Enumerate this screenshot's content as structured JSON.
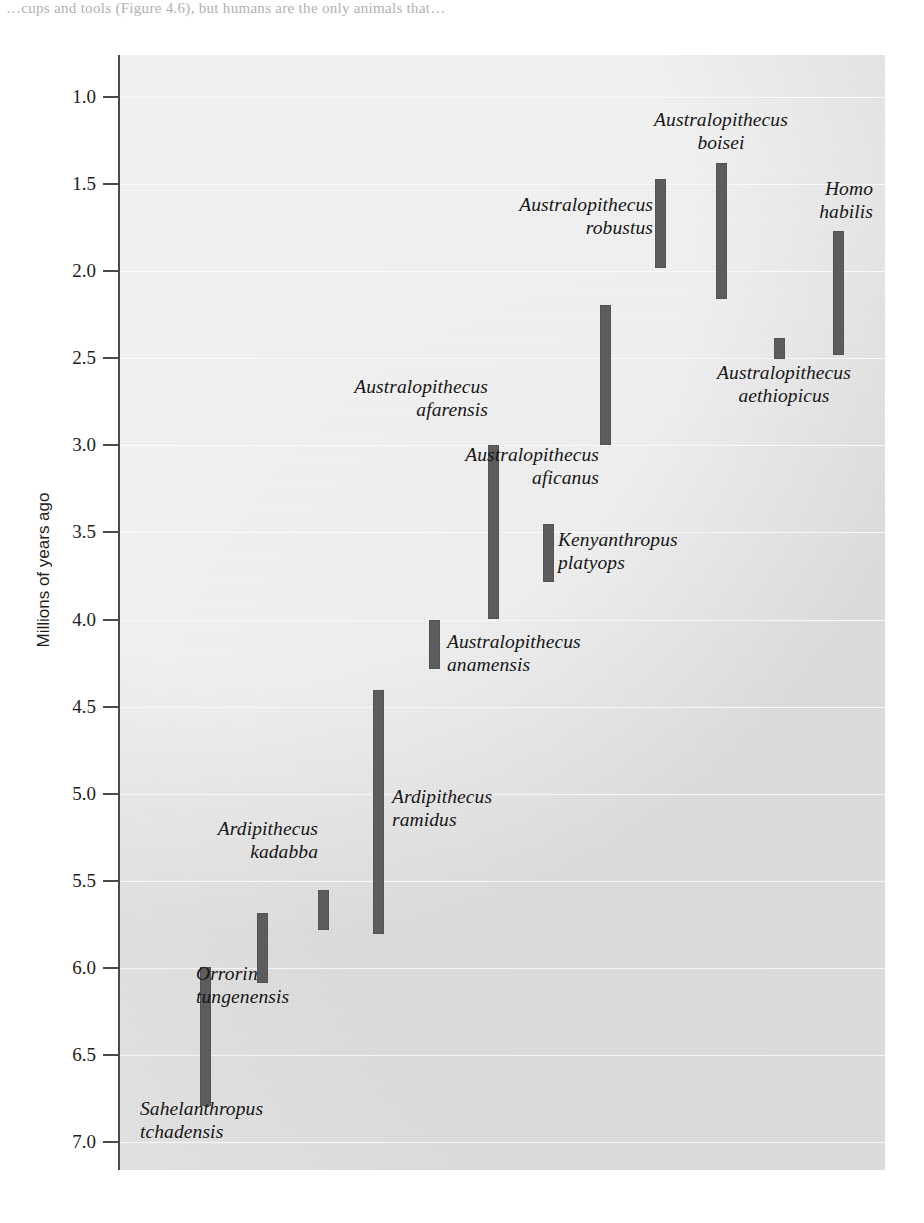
{
  "page": {
    "top_text": "…cups and tools (Figure 4.6), but humans are the only animals that…"
  },
  "chart_data": {
    "type": "bar",
    "orientation": "vertical-range",
    "title": "",
    "xlabel": "",
    "ylabel": "Millions of years ago",
    "ylim": [
      7.2,
      0.75
    ],
    "y_inverted": true,
    "grid": true,
    "legend": "none",
    "tick_labels": [
      "1.0",
      "1.5",
      "2.0",
      "2.5",
      "3.0",
      "3.5",
      "4.0",
      "4.5",
      "5.0",
      "5.5",
      "6.0",
      "6.5",
      "7.0"
    ],
    "tick_values": [
      1.0,
      1.5,
      2.0,
      2.5,
      3.0,
      3.5,
      4.0,
      4.5,
      5.0,
      5.5,
      6.0,
      6.5,
      7.0
    ],
    "bar_color": "#5d5d5d",
    "plot_background": "#e2e2e2",
    "categories": [
      "Sahelanthropus tchadensis",
      "Orrorin tungenensis",
      "Ardipithecus kadabba",
      "Ardipithecus ramidus",
      "Australopithecus anamensis",
      "Australopithecus afarensis",
      "Kenyanthropus platyops",
      "Australopithecus africanus",
      "Australopithecus robustus",
      "Australopithecus boisei",
      "Australopithecus aethiopicus",
      "Homo habilis"
    ],
    "ranges": [
      {
        "name": "Sahelanthropus tchadensis",
        "start_mya": 6.8,
        "end_mya": 6.0
      },
      {
        "name": "Orrorin tungenensis",
        "start_mya": 6.1,
        "end_mya": 5.7
      },
      {
        "name": "Ardipithecus kadabba",
        "start_mya": 5.78,
        "end_mya": 5.55
      },
      {
        "name": "Ardipithecus ramidus",
        "start_mya": 5.8,
        "end_mya": 4.4
      },
      {
        "name": "Australopithecus anamensis",
        "start_mya": 4.28,
        "end_mya": 4.0
      },
      {
        "name": "Australopithecus afarensis",
        "start_mya": 4.0,
        "end_mya": 3.0
      },
      {
        "name": "Kenyanthropus platyops",
        "start_mya": 3.78,
        "end_mya": 3.45
      },
      {
        "name": "Australopithecus africanus",
        "start_mya": 3.0,
        "end_mya": 2.2
      },
      {
        "name": "Australopithecus robustus",
        "start_mya": 1.98,
        "end_mya": 1.47
      },
      {
        "name": "Australopithecus boisei",
        "start_mya": 2.16,
        "end_mya": 1.38
      },
      {
        "name": "Australopithecus aethiopicus",
        "start_mya": 2.5,
        "end_mya": 2.38
      },
      {
        "name": "Homo habilis",
        "start_mya": 2.48,
        "end_mya": 1.77
      }
    ]
  },
  "bars": [
    {
      "key": "sahelanthropus-tchadensis",
      "x": 200,
      "top": 967,
      "height": 139
    },
    {
      "key": "orrorin-tungenensis",
      "x": 257,
      "top": 913,
      "height": 70
    },
    {
      "key": "ardipithecus-kadabba",
      "x": 318,
      "top": 890,
      "height": 40
    },
    {
      "key": "ardipithecus-ramidus",
      "x": 373,
      "top": 690,
      "height": 244
    },
    {
      "key": "australopithecus-anamensis",
      "x": 429,
      "top": 620,
      "height": 49
    },
    {
      "key": "australopithecus-afarensis",
      "x": 488,
      "top": 445,
      "height": 174
    },
    {
      "key": "kenyanthropus-platyops",
      "x": 543,
      "top": 524,
      "height": 58
    },
    {
      "key": "australopithecus-africanus",
      "x": 600,
      "top": 305,
      "height": 140
    },
    {
      "key": "australopithecus-robustus",
      "x": 655,
      "top": 179,
      "height": 89
    },
    {
      "key": "australopithecus-boisei",
      "x": 716,
      "top": 163,
      "height": 136
    },
    {
      "key": "australopithecus-aethiopicus",
      "x": 774,
      "top": 338,
      "height": 21
    },
    {
      "key": "homo-habilis",
      "x": 833,
      "top": 231,
      "height": 124
    }
  ],
  "labels": [
    {
      "key": "sahelanthropus-tchadensis",
      "text": "Sahelanthropus\ntchadensis",
      "left": 140,
      "top": 1097,
      "width": 210,
      "align": "align-left"
    },
    {
      "key": "orrorin-tungenensis",
      "text": "Orrorin\ntungenensis",
      "left": 196,
      "top": 962,
      "width": 175,
      "align": "align-left"
    },
    {
      "key": "ardipithecus-kadabba",
      "text": "Ardipithecus\nkadabba",
      "left": 150,
      "top": 817,
      "width": 168,
      "align": "align-right"
    },
    {
      "key": "ardipithecus-ramidus",
      "text": "Ardipithecus\nramidus",
      "left": 392,
      "top": 785,
      "width": 175,
      "align": "align-left"
    },
    {
      "key": "australopithecus-anamensis",
      "text": "Australopithecus\nanamensis",
      "left": 447,
      "top": 630,
      "width": 216,
      "align": "align-left"
    },
    {
      "key": "australopithecus-afarensis",
      "text": "Australopithecus\nafarensis",
      "left": 272,
      "top": 375,
      "width": 216,
      "align": "align-right"
    },
    {
      "key": "kenyanthropus-platyops",
      "text": "Kenyanthropus\nplatyops",
      "left": 558,
      "top": 528,
      "width": 196,
      "align": "align-left"
    },
    {
      "key": "australopithecus-africanus",
      "text": "Australopithecus\naficanus",
      "left": 383,
      "top": 443,
      "width": 216,
      "align": "align-right"
    },
    {
      "key": "australopithecus-robustus",
      "text": "Australopithecus\nrobustus",
      "left": 437,
      "top": 193,
      "width": 216,
      "align": "align-right"
    },
    {
      "key": "australopithecus-boisei",
      "text": "Australopithecus\nboisei",
      "left": 613,
      "top": 108,
      "width": 216,
      "align": "align-center"
    },
    {
      "key": "australopithecus-aethiopicus",
      "text": "Australopithecus\naethiopicus",
      "left": 676,
      "top": 361,
      "width": 216,
      "align": "align-center"
    },
    {
      "key": "homo-habilis",
      "text": "Homo\nhabilis",
      "left": 733,
      "top": 177,
      "width": 140,
      "align": "align-right"
    }
  ],
  "y_axis": {
    "title": "Millions of years ago"
  }
}
